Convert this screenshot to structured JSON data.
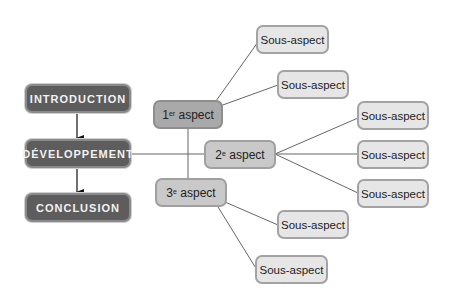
{
  "diagram": {
    "main_steps": [
      {
        "label": "INTRODUCTION"
      },
      {
        "label": "DÉVELOPPEMENT"
      },
      {
        "label": "CONCLUSION"
      }
    ],
    "aspects": [
      {
        "num": "1",
        "sup": "er",
        "label": "aspect"
      },
      {
        "num": "2",
        "sup": "e",
        "label": "aspect"
      },
      {
        "num": "3",
        "sup": "e",
        "label": "aspect"
      }
    ],
    "sub_aspects": [
      {
        "label": "Sous-aspect",
        "parent": "1er aspect"
      },
      {
        "label": "Sous-aspect",
        "parent": "1er aspect"
      },
      {
        "label": "Sous-aspect",
        "parent": "2e aspect"
      },
      {
        "label": "Sous-aspect",
        "parent": "2e aspect"
      },
      {
        "label": "Sous-aspect",
        "parent": "2e aspect"
      },
      {
        "label": "Sous-aspect",
        "parent": "3e aspect"
      },
      {
        "label": "Sous-aspect",
        "parent": "3e aspect"
      }
    ],
    "colors": {
      "main_fill": "#5d5d5d",
      "aspect1_fill": "#a9a9a9",
      "aspect_fill": "#c9c9c9",
      "sub_fill": "#e6e6e6",
      "line": "#555555"
    }
  }
}
